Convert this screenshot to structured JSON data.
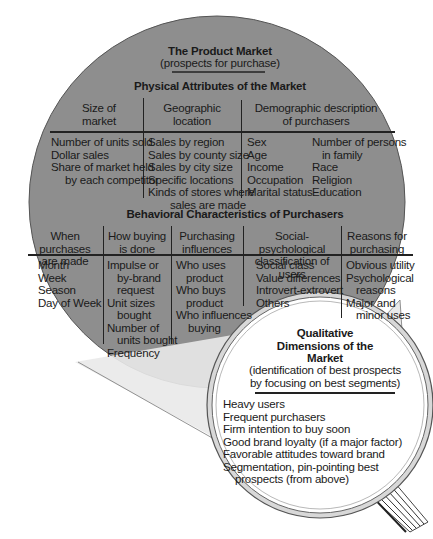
{
  "title": "The Product Market",
  "subtitle": "(prospects for purchase)",
  "physical": {
    "heading": "Physical Attributes of the Market",
    "columns": [
      {
        "header": [
          "Size of",
          "market"
        ],
        "items": [
          "Number of units sold",
          "Dollar sales",
          "Share of market held",
          "by each competitor"
        ]
      },
      {
        "header": [
          "Geographic",
          "location"
        ],
        "items": [
          "Sales by region",
          "Sales by county size",
          "Sales by city size",
          "Specific locations",
          "Kinds of stores where",
          "sales are made"
        ]
      },
      {
        "header": [
          "Demographic description",
          "of purchasers"
        ],
        "items_left": [
          "Sex",
          "Age",
          "Income",
          "Occupation",
          "Marital status"
        ],
        "items_right": [
          "Number of persons",
          "in family",
          "Race",
          "Religion",
          "Education"
        ]
      }
    ]
  },
  "behavioral": {
    "heading": "Behavioral Characteristics of Purchasers",
    "columns": [
      {
        "header": [
          "When purchases",
          "are made"
        ],
        "items": [
          "Month",
          "Week",
          "Season",
          "Day of Week"
        ]
      },
      {
        "header": [
          "How buying",
          "is done"
        ],
        "items": [
          "Impulse or",
          "by-brand",
          "request",
          "Unit sizes",
          "bought",
          "Number of",
          "units bought",
          "Frequency"
        ]
      },
      {
        "header": [
          "Purchasing",
          "influences"
        ],
        "items": [
          "Who uses",
          "product",
          "Who buys",
          "product",
          "Who influences",
          "buying"
        ]
      },
      {
        "header": [
          "Social-psychological",
          "classification of users"
        ],
        "items": [
          "Social class",
          "Value differences",
          "Introvert-extrovert",
          "Others"
        ]
      },
      {
        "header": [
          "Reasons for",
          "purchasing"
        ],
        "items": [
          "Obvious utility",
          "Psychological",
          "reasons",
          "Major and",
          "minor uses"
        ]
      }
    ]
  },
  "qualitative": {
    "title": [
      "Qualitative",
      "Dimensions of the",
      "Market"
    ],
    "subtitle": [
      "(identification of best prospects",
      "by focusing on best segments)"
    ],
    "items": [
      "Heavy users",
      "Frequent purchasers",
      "Firm intention to buy soon",
      "Good brand loyalty (if a major factor)",
      "Favorable attitudes toward brand",
      "Segmentation, pin-pointing best",
      "prospects (from above)"
    ]
  },
  "colors": {
    "market_circle": "#8e8e8e",
    "lens": "#ffffff",
    "ink": "#1a1a1a"
  }
}
